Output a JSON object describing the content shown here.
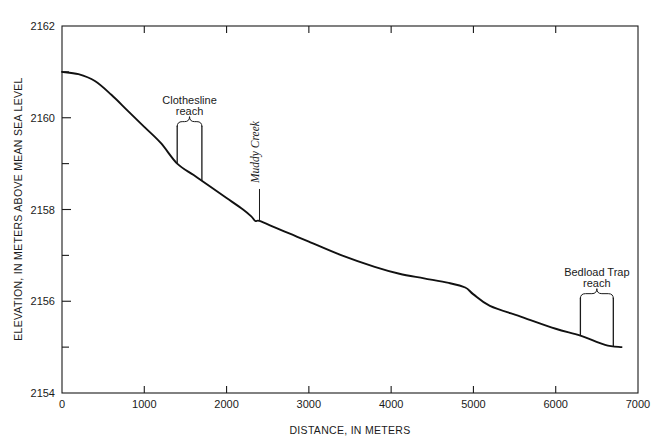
{
  "chart_data": {
    "type": "line",
    "title": "",
    "xlabel": "DISTANCE, IN METERS",
    "ylabel": "ELEVATION, IN METERS ABOVE MEAN SEA LEVEL",
    "xlim": [
      0,
      7000
    ],
    "ylim": [
      2154,
      2162
    ],
    "grid": false,
    "legend": null,
    "x_ticks": [
      0,
      1000,
      2000,
      3000,
      4000,
      5000,
      6000,
      7000
    ],
    "x_tick_labels": [
      "0",
      "1000",
      "2000",
      "3000",
      "4000",
      "5000",
      "6000",
      "7000"
    ],
    "y_ticks": [
      2154,
      2156,
      2158,
      2160,
      2162
    ],
    "y_tick_labels": [
      "2154",
      "2156",
      "2158",
      "2160",
      "2162"
    ],
    "y_minor_ticks": [
      2155,
      2157,
      2159,
      2161
    ],
    "series": [
      {
        "name": "Stream longitudinal profile",
        "x": [
          0,
          200,
          400,
          600,
          800,
          1000,
          1200,
          1400,
          1600,
          1800,
          2000,
          2200,
          2300,
          2350,
          2400,
          2600,
          2800,
          3000,
          3400,
          3800,
          4100,
          4400,
          4700,
          4900,
          5000,
          5200,
          5600,
          6000,
          6300,
          6600,
          6800
        ],
        "y": [
          2161.0,
          2160.95,
          2160.8,
          2160.5,
          2160.15,
          2159.8,
          2159.45,
          2159.0,
          2158.75,
          2158.5,
          2158.25,
          2158.0,
          2157.85,
          2157.75,
          2157.75,
          2157.6,
          2157.45,
          2157.3,
          2157.0,
          2156.75,
          2156.6,
          2156.5,
          2156.4,
          2156.3,
          2156.15,
          2155.9,
          2155.65,
          2155.4,
          2155.25,
          2155.05,
          2155.0
        ]
      }
    ],
    "annotations": [
      {
        "id": "clothesline-reach",
        "label_line1": "Clothesline",
        "label_line2": "reach",
        "style": "brace",
        "x_start": 1400,
        "x_end": 1700,
        "italic": false
      },
      {
        "id": "muddy-creek",
        "label_line1": "Muddy Creek",
        "label_line2": "",
        "style": "leader",
        "x_start": 2400,
        "x_end": 2400,
        "italic": true
      },
      {
        "id": "bedload-trap-reach",
        "label_line1": "Bedload Trap",
        "label_line2": "reach",
        "style": "brace",
        "x_start": 6300,
        "x_end": 6700,
        "italic": false
      }
    ]
  },
  "colors": {
    "ink": "#1a1a1a",
    "profile": "#111111",
    "background": "#ffffff"
  }
}
